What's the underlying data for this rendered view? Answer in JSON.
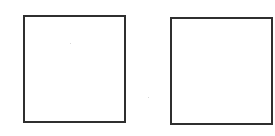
{
  "diagram": {
    "shapes": [
      {
        "id": "left-square",
        "type": "rectangle",
        "fill": "#ffffff",
        "stroke": "#2f2f2f",
        "label": ""
      },
      {
        "id": "right-square",
        "type": "rectangle",
        "fill": "#ffffff",
        "stroke": "#2f2f2f",
        "label": ""
      }
    ],
    "background": "#ffffff"
  }
}
